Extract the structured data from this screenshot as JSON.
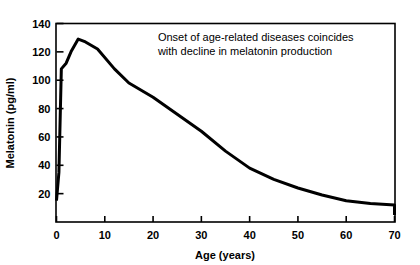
{
  "chart_data": {
    "type": "line",
    "title": "",
    "xlabel": "Age (years)",
    "ylabel": "Melatonin (pg/ml)",
    "xlim": [
      0,
      70
    ],
    "ylim": [
      0,
      140
    ],
    "xticks": [
      0,
      10,
      20,
      30,
      40,
      50,
      60,
      70
    ],
    "yticks": [
      20,
      40,
      60,
      80,
      100,
      120,
      140
    ],
    "xtick_labels": [
      "0",
      "10",
      "20",
      "30",
      "40",
      "50",
      "60",
      "70"
    ],
    "ytick_labels": [
      "20",
      "40",
      "60",
      "80",
      "100",
      "120",
      "140"
    ],
    "grid": false,
    "legend": "none",
    "line_color": "#000000",
    "line_width": 3,
    "series": [
      {
        "name": "Melatonin",
        "x": [
          0,
          0.5,
          1,
          2,
          3,
          4.5,
          6,
          8.5,
          12,
          15,
          20,
          25,
          30,
          35,
          40,
          45,
          50,
          55,
          60,
          65,
          70,
          70
        ],
        "values": [
          15,
          35,
          108,
          112,
          120,
          129,
          127,
          122,
          108,
          98,
          88,
          76,
          64,
          50,
          38,
          30,
          24,
          19,
          15,
          13,
          12,
          5
        ]
      }
    ],
    "annotations": [
      {
        "name": "onset-annotation",
        "lines": [
          "Onset of age-related diseases coincides",
          "with decline in melatonin production"
        ],
        "x": 21,
        "y": 128
      }
    ]
  },
  "figure": {
    "background_color": "#ffffff",
    "frame_color": "#000000",
    "axis_line_width": 1.5
  }
}
